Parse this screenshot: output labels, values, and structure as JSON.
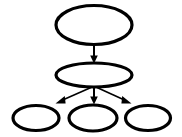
{
  "diagram": {
    "type": "tree-graph",
    "canvas": {
      "width": 182,
      "height": 137,
      "background": "#ffffff"
    },
    "style": {
      "node_fill": "#ffffff",
      "node_stroke": "#000000",
      "node_stroke_width": 3.2,
      "edge_color": "#000000",
      "edge_width": 1.6,
      "arrowhead_fill": "#000000"
    },
    "nodes": [
      {
        "id": "root",
        "shape": "ellipse",
        "label": "",
        "level": 0,
        "cx": 94,
        "cy": 25,
        "rx": 39,
        "ry": 20
      },
      {
        "id": "middle",
        "shape": "ellipse",
        "label": "",
        "level": 1,
        "cx": 94,
        "cy": 75,
        "rx": 39,
        "ry": 12.5
      },
      {
        "id": "leaf-left",
        "shape": "ellipse",
        "label": "",
        "level": 2,
        "cx": 36,
        "cy": 118,
        "rx": 24,
        "ry": 13
      },
      {
        "id": "leaf-center",
        "shape": "ellipse",
        "label": "",
        "level": 2,
        "cx": 93,
        "cy": 118,
        "rx": 25,
        "ry": 13.5
      },
      {
        "id": "leaf-right",
        "shape": "ellipse",
        "label": "",
        "level": 2,
        "cx": 148,
        "cy": 118,
        "rx": 23.5,
        "ry": 13
      }
    ],
    "edges": [
      {
        "id": "edge-root-middle",
        "from": "root",
        "to": "middle",
        "direction": "down",
        "x1": 94,
        "y1": 45,
        "x2": 94,
        "y2": 62,
        "arrowhead": "solid-triangle"
      },
      {
        "id": "edge-middle-leafleft",
        "from": "middle",
        "to": "leaf-left",
        "direction": "down-left",
        "x1": 92,
        "y1": 88,
        "x2": 57,
        "y2": 103,
        "arrowhead": "solid-triangle"
      },
      {
        "id": "edge-middle-leafcenter",
        "from": "middle",
        "to": "leaf-center",
        "direction": "down",
        "x1": 94,
        "y1": 88,
        "x2": 94,
        "y2": 104,
        "arrowhead": "solid-triangle"
      },
      {
        "id": "edge-middle-leafright",
        "from": "middle",
        "to": "leaf-right",
        "direction": "down-right",
        "x1": 96,
        "y1": 88,
        "x2": 130,
        "y2": 103,
        "arrowhead": "solid-triangle"
      }
    ]
  }
}
